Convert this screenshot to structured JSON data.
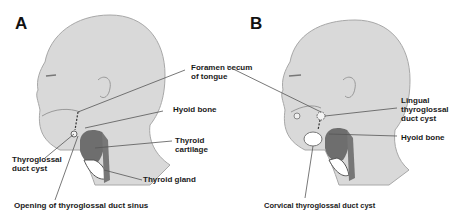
{
  "panels": [
    {
      "id": "A",
      "letter": "A",
      "labels": {
        "foramen_cecum": "Foramen cecum\nof tongue",
        "hyoid_bone": "Hyoid bone",
        "thyroid_cartilage": "Thyroid cartilage",
        "thyroid_gland": "Thyroid gland",
        "thyroglossal_duct_cyst": "Thyroglossal\nduct cyst",
        "opening_sinus": "Opening of thyroglossal duct sinus"
      }
    },
    {
      "id": "B",
      "letter": "B",
      "labels": {
        "lingual_cyst": "Lingual\nthyroglossal\nduct cyst",
        "hyoid_bone": "Hyoid bone",
        "cervical_cyst": "Corvical thyroglossal duct cyst"
      }
    }
  ],
  "colors": {
    "skin": "#d9d9d9",
    "skin_edge": "#a8a8a8",
    "thyroid": "#6e6e6e",
    "leader": "#555555"
  }
}
